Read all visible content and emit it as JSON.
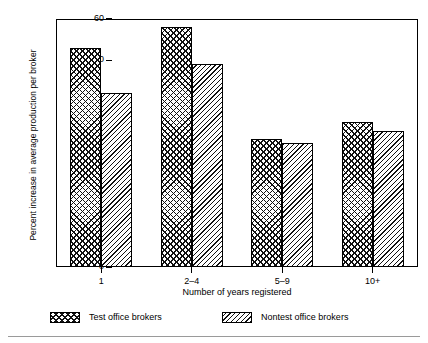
{
  "chart_data": {
    "type": "bar",
    "title": "",
    "subtitle": "",
    "xlabel": "Number of years registered",
    "ylabel": "Percent increase in average production per broker",
    "categories": [
      "1",
      "2–4",
      "5–9",
      "10+"
    ],
    "series": [
      {
        "name": "Test office brokers",
        "values": [
          53,
          58,
          31,
          35
        ],
        "pattern": "cross-hatch"
      },
      {
        "name": "Nontest office brokers",
        "values": [
          42,
          49,
          30,
          33
        ],
        "pattern": "diagonal-hatch"
      }
    ],
    "ylim": [
      0,
      60
    ],
    "yticks": [
      0,
      10,
      20,
      30,
      40,
      50,
      60
    ],
    "ytick_labels": [
      "0",
      "10",
      "20",
      "30",
      "40",
      "50",
      "60"
    ],
    "grid": false,
    "legend_position": "below-axes",
    "colors": {
      "ink": "#000000",
      "background": "#ffffff",
      "rule": "#9a9a9a"
    }
  },
  "legend": {
    "items": [
      {
        "label": "Test office brokers"
      },
      {
        "label": "Nontest office brokers"
      }
    ]
  }
}
